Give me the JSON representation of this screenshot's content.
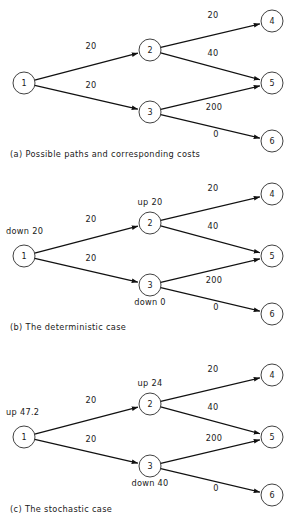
{
  "figure": {
    "node_radius": 11,
    "ink_color": "#111111",
    "node_stroke_color": "#2b2b2b",
    "background_color": "#ffffff"
  },
  "chart_data": {
    "type": "diagram",
    "panels": [
      {
        "id": "a",
        "caption": "(a) Possible paths and corresponding costs",
        "nodes": [
          {
            "id": "1",
            "label": "1",
            "x": 24,
            "y": 83
          },
          {
            "id": "2",
            "label": "2",
            "x": 150,
            "y": 50
          },
          {
            "id": "3",
            "label": "3",
            "x": 150,
            "y": 112
          },
          {
            "id": "4",
            "label": "4",
            "x": 272,
            "y": 21
          },
          {
            "id": "5",
            "label": "5",
            "x": 272,
            "y": 83
          },
          {
            "id": "6",
            "label": "6",
            "x": 272,
            "y": 141
          }
        ],
        "edges": [
          {
            "from": "1",
            "to": "2",
            "cost": "20",
            "lx": 91,
            "ly": 49
          },
          {
            "from": "1",
            "to": "3",
            "cost": "20",
            "lx": 91,
            "ly": 88
          },
          {
            "from": "2",
            "to": "4",
            "cost": "20",
            "lx": 213,
            "ly": 18
          },
          {
            "from": "2",
            "to": "5",
            "cost": "40",
            "lx": 213,
            "ly": 56
          },
          {
            "from": "3",
            "to": "5",
            "cost": "200",
            "lx": 214,
            "ly": 110
          },
          {
            "from": "3",
            "to": "6",
            "cost": "0",
            "lx": 216,
            "ly": 137
          }
        ],
        "state_labels": []
      },
      {
        "id": "b",
        "caption": "(b) The deterministic case",
        "nodes": [
          {
            "id": "1",
            "label": "1",
            "x": 24,
            "y": 256
          },
          {
            "id": "2",
            "label": "2",
            "x": 150,
            "y": 223
          },
          {
            "id": "3",
            "label": "3",
            "x": 150,
            "y": 285
          },
          {
            "id": "4",
            "label": "4",
            "x": 272,
            "y": 194
          },
          {
            "id": "5",
            "label": "5",
            "x": 272,
            "y": 256
          },
          {
            "id": "6",
            "label": "6",
            "x": 272,
            "y": 314
          }
        ],
        "edges": [
          {
            "from": "1",
            "to": "2",
            "cost": "20",
            "lx": 91,
            "ly": 222
          },
          {
            "from": "1",
            "to": "3",
            "cost": "20",
            "lx": 91,
            "ly": 261
          },
          {
            "from": "2",
            "to": "4",
            "cost": "20",
            "lx": 213,
            "ly": 191
          },
          {
            "from": "2",
            "to": "5",
            "cost": "40",
            "lx": 213,
            "ly": 229
          },
          {
            "from": "3",
            "to": "5",
            "cost": "200",
            "lx": 214,
            "ly": 283
          },
          {
            "from": "3",
            "to": "6",
            "cost": "0",
            "lx": 216,
            "ly": 310
          }
        ],
        "state_labels": [
          {
            "text": "down 20",
            "x": 6,
            "y": 234,
            "anchor": "start"
          },
          {
            "text": "up 20",
            "x": 150,
            "y": 205,
            "anchor": "middle"
          },
          {
            "text": "down 0",
            "x": 150,
            "y": 305,
            "anchor": "middle"
          }
        ]
      },
      {
        "id": "c",
        "caption": "(c) The stochastic case",
        "nodes": [
          {
            "id": "1",
            "label": "1",
            "x": 24,
            "y": 437
          },
          {
            "id": "2",
            "label": "2",
            "x": 150,
            "y": 404
          },
          {
            "id": "3",
            "label": "3",
            "x": 150,
            "y": 466
          },
          {
            "id": "4",
            "label": "4",
            "x": 272,
            "y": 375
          },
          {
            "id": "5",
            "label": "5",
            "x": 272,
            "y": 437
          },
          {
            "id": "6",
            "label": "6",
            "x": 272,
            "y": 495
          }
        ],
        "edges": [
          {
            "from": "1",
            "to": "2",
            "cost": "20",
            "lx": 91,
            "ly": 403
          },
          {
            "from": "1",
            "to": "3",
            "cost": "20",
            "lx": 91,
            "ly": 442
          },
          {
            "from": "2",
            "to": "4",
            "cost": "20",
            "lx": 213,
            "ly": 372
          },
          {
            "from": "2",
            "to": "5",
            "cost": "40",
            "lx": 213,
            "ly": 410
          },
          {
            "from": "3",
            "to": "5",
            "cost": "200",
            "lx": 214,
            "ly": 441
          },
          {
            "from": "3",
            "to": "6",
            "cost": "0",
            "lx": 216,
            "ly": 491
          }
        ],
        "state_labels": [
          {
            "text": "up 47.2",
            "x": 6,
            "y": 415,
            "anchor": "start"
          },
          {
            "text": "up 24",
            "x": 150,
            "y": 386,
            "anchor": "middle"
          },
          {
            "text": "down 40",
            "x": 150,
            "y": 486,
            "anchor": "middle"
          }
        ]
      }
    ]
  }
}
